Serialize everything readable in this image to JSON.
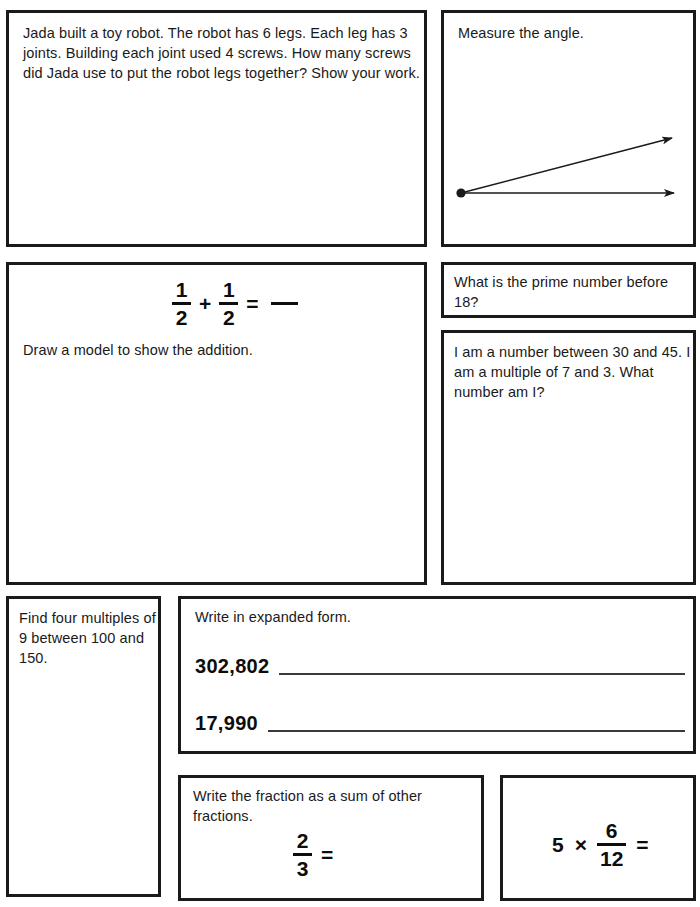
{
  "worksheet": {
    "page_width": 700,
    "page_height": 907,
    "ink_color": "#1a1a1a",
    "paper_color": "#ffffff"
  },
  "problems": {
    "word_problem": {
      "text": "Jada built a toy robot. The robot has 6 legs. Each leg has 3 joints. Building each joint used 4 screws. How many screws did Jada use to put the robot legs together? Show your work."
    },
    "angle": {
      "prompt": "Measure the angle.",
      "figure": {
        "type": "angle",
        "vertex": [
          17,
          180
        ],
        "ray_horizontal_end": [
          236,
          180
        ],
        "ray_diagonal_end": [
          234,
          124
        ]
      }
    },
    "fraction_addition": {
      "equation": {
        "left_numerator": "1",
        "left_denominator": "2",
        "operator": "+",
        "right_numerator": "1",
        "right_denominator": "2",
        "equals": "=",
        "answer_blank": "—"
      },
      "instruction": "Draw a model to show the addition."
    },
    "prime": {
      "text": "What is the prime number before 18?"
    },
    "riddle": {
      "text": "I am a number between 30 and 45. I am a multiple of 7 and 3. What number am I?"
    },
    "multiples": {
      "text": "Find four multiples of 9 between 100 and 150."
    },
    "expanded_form": {
      "prompt": "Write in expanded form.",
      "rows": [
        {
          "number": "302,802"
        },
        {
          "number": "17,990"
        }
      ]
    },
    "fraction_sum": {
      "prompt": "Write the fraction as a sum of other fractions.",
      "equation": {
        "numerator": "2",
        "denominator": "3",
        "equals": "="
      }
    },
    "multiply_fraction": {
      "equation": {
        "whole": "5",
        "operator": "×",
        "numerator": "6",
        "denominator": "12",
        "equals": "="
      }
    }
  }
}
